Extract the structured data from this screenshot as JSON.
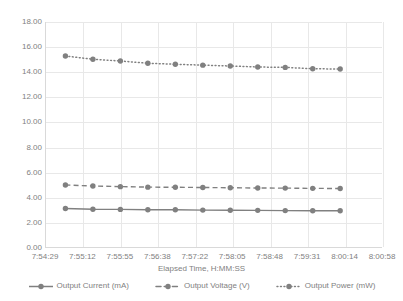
{
  "chart_data": {
    "type": "line",
    "title": "",
    "xlabel": "Elapsed Time, H:MM:SS",
    "ylabel": "",
    "ylim": [
      0,
      18
    ],
    "y_ticks": [
      "0.00",
      "2.00",
      "4.00",
      "6.00",
      "8.00",
      "10.00",
      "12.00",
      "14.00",
      "16.00",
      "18.00"
    ],
    "x_ticks": [
      "7:54:29",
      "7:55:12",
      "7:55:55",
      "7:56:38",
      "7:57:22",
      "7:58:05",
      "7:58:48",
      "7:59:31",
      "8:00:14",
      "8:00:58"
    ],
    "grid": true,
    "legend_position": "bottom",
    "x": [
      "7:55:02",
      "7:55:26",
      "7:55:50",
      "7:56:14",
      "7:56:38",
      "7:57:02",
      "7:57:26",
      "7:57:50",
      "7:58:14",
      "7:58:38",
      "7:59:02"
    ],
    "series": [
      {
        "name": "Output Current (mA)",
        "style": "solid",
        "color": "#808080",
        "values": [
          3.08,
          3.02,
          3.01,
          2.98,
          2.98,
          2.95,
          2.94,
          2.93,
          2.91,
          2.9,
          2.9
        ]
      },
      {
        "name": "Output Voltage (V)",
        "style": "dashed",
        "color": "#808080",
        "values": [
          4.96,
          4.88,
          4.83,
          4.79,
          4.78,
          4.76,
          4.74,
          4.72,
          4.71,
          4.69,
          4.68
        ]
      },
      {
        "name": "Output Power (mW)",
        "style": "dotted",
        "color": "#808080",
        "values": [
          15.28,
          15.02,
          14.88,
          14.7,
          14.62,
          14.55,
          14.48,
          14.4,
          14.37,
          14.26,
          14.24
        ]
      }
    ]
  },
  "legend": {
    "items": [
      {
        "label": "Output Current (mA)",
        "style": "solid"
      },
      {
        "label": "Output Voltage (V)",
        "style": "dashed"
      },
      {
        "label": "Output Power (mW)",
        "style": "dotted"
      }
    ]
  },
  "axis": {
    "x_title": "Elapsed Time, H:MM:SS"
  },
  "colors": {
    "series": "#808080",
    "gridline": "#e8e8e8",
    "axis": "#d9d9d9",
    "text": "#7f7f7f"
  }
}
